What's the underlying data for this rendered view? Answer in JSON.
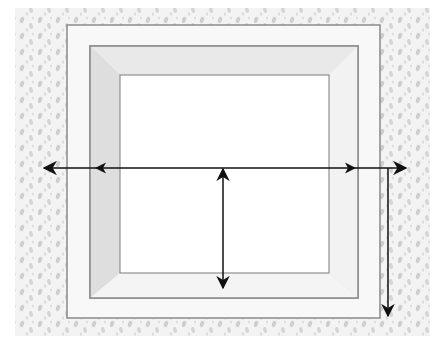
{
  "diagram": {
    "title": "",
    "colors": {
      "background": "#ffffff",
      "wall_texture_base": "#f1f1f1",
      "wall_texture_spots": "#c9c9c9",
      "frame_face": "#f7f7f7",
      "frame_line": "#8a8a8a",
      "mat_bevel": "#e4e4e4",
      "mat_bevel_dark": "#d6d6d6",
      "opening": "#ffffff",
      "arrow": "#111111"
    },
    "elements": [
      {
        "name": "wall-texture",
        "label": ""
      },
      {
        "name": "outer-frame",
        "label": ""
      },
      {
        "name": "mat-border",
        "label": ""
      },
      {
        "name": "inner-opening",
        "label": ""
      },
      {
        "name": "width-arrow",
        "label": "",
        "direction": "horizontal",
        "heads": "both-ends-plus-inner-marks"
      },
      {
        "name": "opening-height-arrow",
        "label": "",
        "direction": "vertical",
        "heads": "both"
      },
      {
        "name": "frame-height-arrow",
        "label": "",
        "direction": "vertical",
        "heads": "down"
      }
    ]
  }
}
